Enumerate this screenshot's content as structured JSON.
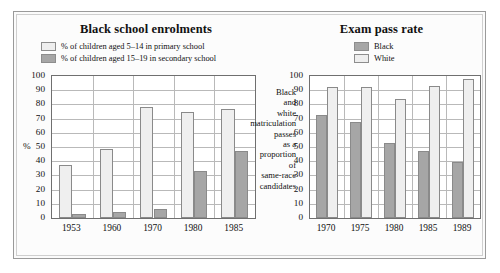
{
  "figure": {
    "background": "#fcfcfc",
    "frame_color": "#9a9a9a"
  },
  "colors": {
    "light_bar": "#efefef",
    "dark_bar": "#a6a6a6",
    "axis": "#6f6f6f",
    "grid": "#b9b9b9",
    "text": "#111111"
  },
  "center_caption": {
    "lines": [
      "Black",
      "and",
      "white",
      "matriculation",
      "passes",
      "as a",
      "proportion",
      "of",
      "same-race",
      "candidates"
    ]
  },
  "chart_data": [
    {
      "id": "black-school-enrolments",
      "type": "bar",
      "title": "Black school enrolments",
      "xlabel": "",
      "ylabel": "%",
      "ylim": [
        0,
        100
      ],
      "ytick_step": 10,
      "yticks": [
        "0",
        "10",
        "20",
        "30",
        "40",
        "50",
        "60",
        "70",
        "80",
        "90",
        "100"
      ],
      "grid": true,
      "legend_position": "top",
      "categories": [
        "1953",
        "1960",
        "1970",
        "1980",
        "1985"
      ],
      "series": [
        {
          "name": "% of children aged 5–14 in primary school",
          "swatch": "light",
          "values": [
            37,
            48.5,
            78.5,
            74.5,
            76.5
          ]
        },
        {
          "name": "% of children aged 15–19 in secondary school",
          "swatch": "dark",
          "values": [
            3,
            4,
            6.5,
            33,
            47
          ]
        }
      ]
    },
    {
      "id": "exam-pass-rate",
      "type": "bar",
      "title": "Exam pass rate",
      "xlabel": "",
      "ylabel": "",
      "ylim": [
        0,
        100
      ],
      "ytick_step": 10,
      "yticks": [
        "0",
        "10",
        "20",
        "30",
        "40",
        "50",
        "60",
        "70",
        "80",
        "90",
        "100"
      ],
      "grid": true,
      "legend_position": "top",
      "categories": [
        "1970",
        "1975",
        "1980",
        "1985",
        "1989"
      ],
      "series": [
        {
          "name": "Black",
          "swatch": "dark",
          "values": [
            72.5,
            67.5,
            53,
            47,
            39.5
          ]
        },
        {
          "name": "White",
          "swatch": "light",
          "values": [
            92,
            92,
            84,
            93,
            98
          ]
        }
      ]
    }
  ]
}
